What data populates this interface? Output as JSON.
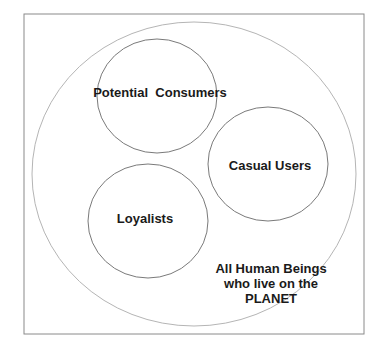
{
  "diagram": {
    "type": "nested-circles",
    "colors": {
      "frame": "#8a8a8a",
      "outer_circle": "#b5b5b5",
      "inner_circle": "#7a7a7a",
      "text": "#1a1a1a"
    },
    "outer": {
      "label_lines": [
        "All Human Beings",
        "who live on the",
        "PLANET"
      ]
    },
    "circles": [
      {
        "id": "potential-consumers",
        "label": "Potential  Consumers"
      },
      {
        "id": "casual-users",
        "label": "Casual Users"
      },
      {
        "id": "loyalists",
        "label": "Loyalists"
      }
    ]
  }
}
